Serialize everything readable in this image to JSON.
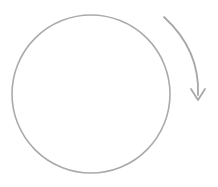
{
  "canvas": {
    "width": 218,
    "height": 187,
    "background_color": "#ffffff",
    "title": "Rotation direction diagram"
  },
  "palette": {
    "outline_gray": "#aaaaaa",
    "arrow_gray": "#a8a8a8",
    "background": "#ffffff"
  },
  "shapes": {
    "circle": {
      "name": "circle-outline",
      "center_x": 91,
      "center_y": 94,
      "radius": 79,
      "stroke_color": "#aaaaaa",
      "stroke_width": 1.6,
      "fill": "none"
    },
    "arrow": {
      "name": "clockwise-curved-arrow",
      "direction": "clockwise",
      "stroke_color": "#a8a8a8",
      "stroke_width": 1.8,
      "start_x": 164,
      "start_y": 17,
      "end_x": 198,
      "end_y": 95,
      "control_x": 200,
      "control_y": 50,
      "head_tip_x": 198,
      "head_tip_y": 100,
      "head_left_x": 191,
      "head_left_y": 89,
      "head_right_x": 205,
      "head_right_y": 89
    }
  },
  "labels": {
    "caption": ""
  }
}
